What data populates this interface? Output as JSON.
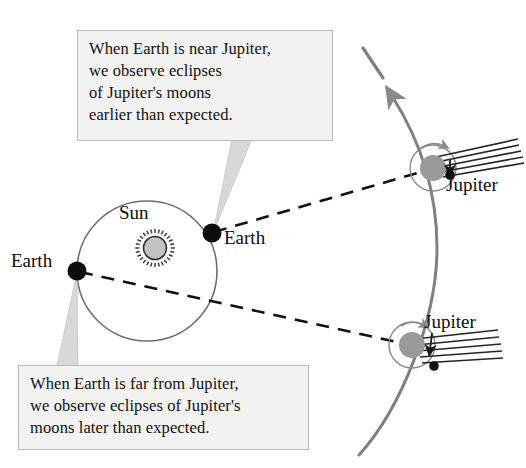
{
  "figure": {
    "background_color": "#ffffff"
  },
  "callouts": {
    "near": {
      "name": "near-jupiter-callout",
      "lines": [
        "When Earth is near Jupiter,",
        "we observe eclipses",
        "of Jupiter's moons",
        "earlier than expected."
      ],
      "box_fill": "#f2f2f0",
      "box_border": "#b9b9b6"
    },
    "far": {
      "name": "far-jupiter-callout",
      "lines": [
        "When Earth is far from Jupiter,",
        "we observe eclipses of Jupiter's",
        "moons later than expected."
      ],
      "box_fill": "#f2f2f0",
      "box_border": "#b9b9b6"
    }
  },
  "labels": {
    "sun": "Sun",
    "earth_near": "Earth",
    "earth_far": "Earth",
    "jupiter_top": "Jupiter",
    "jupiter_bottom": "Jupiter"
  },
  "colors": {
    "orbit_line": "#6e6e6e",
    "jupiter_orbit_arc": "#808080",
    "sight_line": "#111111",
    "body_dark": "#101010",
    "planet_gray": "#999999",
    "sun_gray": "#b0b0b0",
    "shadow_line": "#262626",
    "leader_gray": "#d2d2d2"
  },
  "geometry": {
    "sun": {
      "cx": 155,
      "cy": 248,
      "r": 15,
      "spikes": 28
    },
    "earth_orbit": {
      "cx": 147,
      "cy": 271,
      "r": 70
    },
    "earth_near": {
      "cx": 212,
      "cy": 233,
      "r": 9
    },
    "earth_far": {
      "cx": 77,
      "cy": 271,
      "r": 9
    },
    "jupiter_top": {
      "planet": {
        "cx": 433,
        "cy": 168,
        "r": 13
      },
      "moon_orbit_r": 23,
      "moon": {
        "cx": 449,
        "cy": 175,
        "r": 5
      }
    },
    "jupiter_bottom": {
      "planet": {
        "cx": 412,
        "cy": 345,
        "r": 13
      },
      "moon_orbit_r": 23,
      "moon": {
        "cx": 433,
        "cy": 366,
        "r": 5
      }
    },
    "sight_lines": [
      {
        "name": "earth-near-to-jupiter-top",
        "x1": 212,
        "y1": 233,
        "x2": 433,
        "y2": 168
      },
      {
        "name": "earth-far-to-jupiter-bottom",
        "x1": 77,
        "y1": 271,
        "x2": 412,
        "y2": 345
      }
    ]
  }
}
